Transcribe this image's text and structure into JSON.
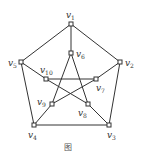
{
  "diagram": {
    "type": "graph",
    "name": "Petersen graph",
    "nodes": [
      {
        "id": "v1",
        "base": "v",
        "sub": "1",
        "x": 71,
        "y": 24,
        "lx": 66,
        "ly": 18
      },
      {
        "id": "v2",
        "base": "v",
        "sub": "2",
        "x": 120,
        "y": 62,
        "lx": 125,
        "ly": 66
      },
      {
        "id": "v3",
        "base": "v",
        "sub": "3",
        "x": 109,
        "y": 125,
        "lx": 107,
        "ly": 138
      },
      {
        "id": "v4",
        "base": "v",
        "sub": "4",
        "x": 34,
        "y": 125,
        "lx": 28,
        "ly": 138
      },
      {
        "id": "v5",
        "base": "v",
        "sub": "5",
        "x": 21,
        "y": 62,
        "lx": 8,
        "ly": 66
      },
      {
        "id": "v6",
        "base": "v",
        "sub": "6",
        "x": 71,
        "y": 53,
        "lx": 76,
        "ly": 57
      },
      {
        "id": "v7",
        "base": "v",
        "sub": "7",
        "x": 96,
        "y": 79,
        "lx": 96,
        "ly": 91
      },
      {
        "id": "v8",
        "base": "v",
        "sub": "8",
        "x": 88,
        "y": 104,
        "lx": 78,
        "ly": 116
      },
      {
        "id": "v9",
        "base": "v",
        "sub": "9",
        "x": 52,
        "y": 104,
        "lx": 37,
        "ly": 105
      },
      {
        "id": "v10",
        "base": "v",
        "sub": "10",
        "x": 46,
        "y": 79,
        "lx": 40,
        "ly": 73
      }
    ],
    "edges": [
      [
        "v1",
        "v2"
      ],
      [
        "v2",
        "v3"
      ],
      [
        "v3",
        "v4"
      ],
      [
        "v4",
        "v5"
      ],
      [
        "v5",
        "v1"
      ],
      [
        "v1",
        "v6"
      ],
      [
        "v2",
        "v7"
      ],
      [
        "v3",
        "v8"
      ],
      [
        "v4",
        "v9"
      ],
      [
        "v5",
        "v10"
      ],
      [
        "v6",
        "v8"
      ],
      [
        "v6",
        "v9"
      ],
      [
        "v7",
        "v9"
      ],
      [
        "v7",
        "v10"
      ],
      [
        "v8",
        "v10"
      ]
    ],
    "caption_fragment": "图"
  }
}
